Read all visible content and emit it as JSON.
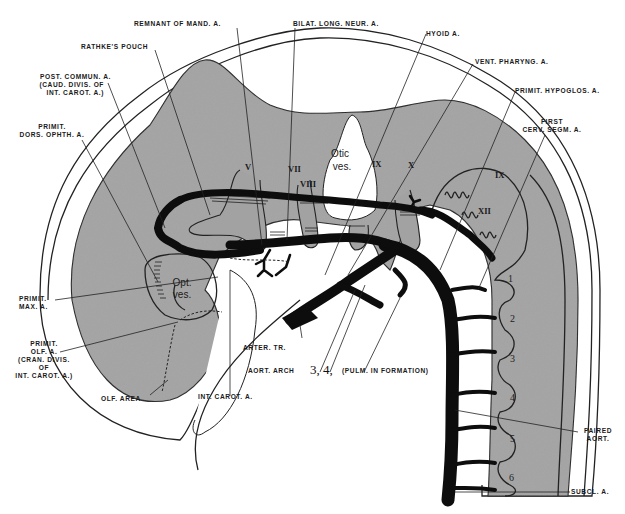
{
  "diagram": {
    "structures": {
      "otic_vesicle": [
        "Otic",
        "ves."
      ],
      "optic_vesicle": [
        "Opt.",
        "ves."
      ]
    },
    "cranial_nerves": [
      "V",
      "VII",
      "VIII",
      "IX",
      "X",
      "IX",
      "XII"
    ],
    "somite_numbers": [
      "1",
      "2",
      "3",
      "4",
      "5",
      "6"
    ],
    "aortic_arch_numbers": "3, 4,",
    "labels": {
      "remnant_mand": "REMNANT OF MAND. A.",
      "bilat_long_neur": "BILAT. LONG. NEUR. A.",
      "hyoid": "HYOID A.",
      "rathkes_pouch": "RATHKE'S POUCH",
      "vent_pharyng": "VENT. PHARYNG. A.",
      "post_commun": [
        "POST. COMMUN. A.",
        "(CAUD. DIVIS. OF",
        "INT. CAROT. A.)"
      ],
      "primit_hypoglos": "PRIMIT. HYPOGLOS. A.",
      "first_cerv_segm": [
        "FIRST",
        "CERV. SEGM. A."
      ],
      "primit_dors_ophth": [
        "PRIMIT.",
        "DORS. OPHTH. A."
      ],
      "primit_max": [
        "PRIMIT.",
        "MAX. A."
      ],
      "primit_olf": [
        "PRIMIT.",
        "OLF. A.",
        "(CRAN. DIVIS.",
        "OF",
        "INT. CAROT. A.)"
      ],
      "arter_tr": "ARTER. TR.",
      "aort_arch": "AORT. ARCH",
      "pulm_in_formation": "(PULM. IN FORMATION)",
      "olf_area": "OLF. AREA",
      "int_carot": "INT. CAROT. A.",
      "paired_aort": [
        "PAIRED",
        "AORT."
      ],
      "subcl": "SUBCL. A."
    },
    "colors": {
      "tissue_gray": "#a2a2a2",
      "vessel_black": "#0d0d0d",
      "background": "#ffffff"
    }
  }
}
